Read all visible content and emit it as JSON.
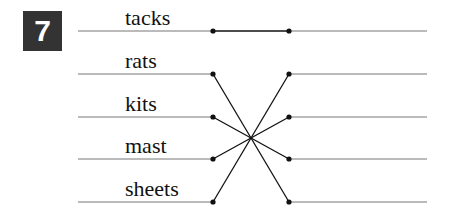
{
  "exercise": {
    "number": "7"
  },
  "words": [
    "tacks",
    "rats",
    "kits",
    "mast",
    "sheets"
  ],
  "rows_y": [
    31,
    74,
    117,
    159,
    202
  ],
  "connections": [
    [
      0,
      0
    ],
    [
      1,
      4
    ],
    [
      2,
      3
    ],
    [
      3,
      2
    ],
    [
      4,
      1
    ]
  ],
  "colors": {
    "badge_bg": "#333333",
    "line": "#777777",
    "connector": "#111111"
  }
}
